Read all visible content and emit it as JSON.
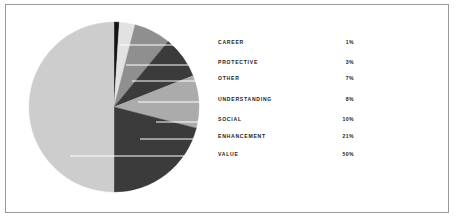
{
  "figure": {
    "background_color": "#ffffff",
    "panel_border_color": "#9a9a9a",
    "leader_line_color": "#ffffff"
  },
  "legend": {
    "rows": [
      {
        "label": "CAREER",
        "value": "1%",
        "y": 31
      },
      {
        "label": "PROTECTIVE",
        "value": "3%",
        "y": 51
      },
      {
        "label": "OTHER",
        "value": "7%",
        "y": 67
      },
      {
        "label": "UNDERSTANDING",
        "value": "8%",
        "y": 88
      },
      {
        "label": "SOCIAL",
        "value": "10%",
        "y": 108
      },
      {
        "label": "ENHANCEMENT",
        "value": "21%",
        "y": 125
      },
      {
        "label": "VALUE",
        "value": "50%",
        "y": 143
      }
    ]
  },
  "chart_data": {
    "type": "pie",
    "title": "",
    "xlabel": "",
    "ylabel": "",
    "legend_position": "right",
    "grid": false,
    "start_angle_deg": 90,
    "direction": "clockwise",
    "center": {
      "cx": 86,
      "cy": 99
    },
    "radius": 85,
    "categories": [
      "CAREER",
      "PROTECTIVE",
      "OTHER",
      "UNDERSTANDING",
      "SOCIAL",
      "ENHANCEMENT",
      "VALUE"
    ],
    "values": [
      1,
      3,
      7,
      8,
      10,
      21,
      50
    ],
    "value_labels": [
      "1%",
      "3%",
      "7%",
      "8%",
      "10%",
      "21%",
      "50%"
    ],
    "unit": "%",
    "total": 100,
    "slice_colors": [
      "#141414",
      "#e2e2e2",
      "#8f8f8f",
      "#3b3b3b",
      "#ababab",
      "#3b3b3b",
      "#cdcdcd"
    ],
    "leaders": [
      {
        "category": "CAREER",
        "x1": 92,
        "y1": 37,
        "x2": 206,
        "y2": 37
      },
      {
        "category": "PROTECTIVE",
        "x1": 98,
        "y1": 57,
        "x2": 206,
        "y2": 57
      },
      {
        "category": "OTHER",
        "x1": 104,
        "y1": 73,
        "x2": 206,
        "y2": 73
      },
      {
        "category": "UNDERSTANDING",
        "x1": 110,
        "y1": 94,
        "x2": 206,
        "y2": 94
      },
      {
        "category": "SOCIAL",
        "x1": 128,
        "y1": 114,
        "x2": 206,
        "y2": 114
      },
      {
        "category": "ENHANCEMENT",
        "x1": 112,
        "y1": 131,
        "x2": 206,
        "y2": 131
      },
      {
        "category": "VALUE",
        "x1": 42,
        "y1": 148,
        "x2": 206,
        "y2": 148
      }
    ]
  }
}
